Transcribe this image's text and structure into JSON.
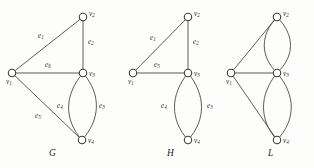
{
  "figure": {
    "background_color": "#fdfdfc",
    "stroke_color": "#4a4a48",
    "node_fill_color": "#ffffff"
  },
  "graphs": [
    {
      "id": "G",
      "caption": "G",
      "vertices": [
        {
          "id": "v1",
          "label": "v",
          "sub": "1",
          "x": 12,
          "y": 73
        },
        {
          "id": "v2",
          "label": "v",
          "sub": "2",
          "x": 83,
          "y": 17
        },
        {
          "id": "v3",
          "label": "v",
          "sub": "3",
          "x": 83,
          "y": 73
        },
        {
          "id": "v4",
          "label": "v",
          "sub": "4",
          "x": 82,
          "y": 140
        }
      ],
      "edges": [
        {
          "id": "e1",
          "label": "e",
          "sub": "1",
          "from": "v1",
          "to": "v2",
          "kind": "straight",
          "label_x": 38,
          "label_y": 36
        },
        {
          "id": "e2",
          "label": "e",
          "sub": "2",
          "from": "v2",
          "to": "v3",
          "kind": "straight",
          "label_x": 88,
          "label_y": 42
        },
        {
          "id": "e6",
          "label": "e",
          "sub": "6",
          "from": "v1",
          "to": "v3",
          "kind": "straight",
          "label_x": 45,
          "label_y": 64
        },
        {
          "id": "e5",
          "label": "e",
          "sub": "5",
          "from": "v1",
          "to": "v4",
          "kind": "straight",
          "label_x": 39,
          "label_y": 115
        },
        {
          "id": "e4",
          "label": "e",
          "sub": "4",
          "from": "v3",
          "to": "v4",
          "kind": "curve-left",
          "label_x": 60,
          "label_y": 106
        },
        {
          "id": "e3",
          "label": "e",
          "sub": "3",
          "from": "v3",
          "to": "v4",
          "kind": "curve-right",
          "label_x": 98,
          "label_y": 106
        }
      ]
    },
    {
      "id": "H",
      "caption": "H",
      "vertices": [
        {
          "id": "v1",
          "label": "v",
          "sub": "1",
          "x": 133,
          "y": 73
        },
        {
          "id": "v2",
          "label": "v",
          "sub": "2",
          "x": 188,
          "y": 17
        },
        {
          "id": "v3",
          "label": "v",
          "sub": "3",
          "x": 188,
          "y": 73
        },
        {
          "id": "v4",
          "label": "v",
          "sub": "4",
          "x": 188,
          "y": 140
        }
      ],
      "edges": [
        {
          "id": "e1",
          "label": "e",
          "sub": "1",
          "from": "v1",
          "to": "v2",
          "kind": "straight",
          "label_x": 152,
          "label_y": 38
        },
        {
          "id": "e2",
          "label": "e",
          "sub": "2",
          "from": "v2",
          "to": "v3",
          "kind": "straight",
          "label_x": 193,
          "label_y": 42
        },
        {
          "id": "e5",
          "label": "e",
          "sub": "5",
          "from": "v1",
          "to": "v3",
          "kind": "straight",
          "label_x": 155,
          "label_y": 64
        },
        {
          "id": "e4",
          "label": "e",
          "sub": "4",
          "from": "v3",
          "to": "v4",
          "kind": "curve-left",
          "label_x": 163,
          "label_y": 106
        },
        {
          "id": "e3",
          "label": "e",
          "sub": "3",
          "from": "v3",
          "to": "v4",
          "kind": "curve-right",
          "label_x": 206,
          "label_y": 106
        }
      ]
    },
    {
      "id": "L",
      "caption": "L",
      "vertices": [
        {
          "id": "v1",
          "label": "v",
          "sub": "1",
          "x": 231,
          "y": 73
        },
        {
          "id": "v2",
          "label": "v",
          "sub": "2",
          "x": 277,
          "y": 17
        },
        {
          "id": "v3",
          "label": "v",
          "sub": "3",
          "x": 277,
          "y": 73
        },
        {
          "id": "v4",
          "label": "v",
          "sub": "4",
          "x": 277,
          "y": 140
        }
      ],
      "edges": [
        {
          "id": "L-v1v2",
          "label": "",
          "sub": "",
          "from": "v1",
          "to": "v2",
          "kind": "straight"
        },
        {
          "id": "L-v1v3",
          "label": "",
          "sub": "",
          "from": "v1",
          "to": "v3",
          "kind": "straight"
        },
        {
          "id": "L-v1v4",
          "label": "",
          "sub": "",
          "from": "v1",
          "to": "v4",
          "kind": "straight"
        },
        {
          "id": "L-v2v3-a",
          "label": "",
          "sub": "",
          "from": "v2",
          "to": "v3",
          "kind": "curve-left"
        },
        {
          "id": "L-v2v3-b",
          "label": "",
          "sub": "",
          "from": "v2",
          "to": "v3",
          "kind": "curve-right"
        },
        {
          "id": "L-v3v4-a",
          "label": "",
          "sub": "",
          "from": "v3",
          "to": "v4",
          "kind": "curve-left"
        },
        {
          "id": "L-v3v4-b",
          "label": "",
          "sub": "",
          "from": "v3",
          "to": "v4",
          "kind": "curve-right"
        }
      ]
    }
  ],
  "captions": [
    {
      "text": "G",
      "x": 49,
      "y": 153
    },
    {
      "text": "H",
      "x": 167,
      "y": 153
    },
    {
      "text": "L",
      "x": 268,
      "y": 153
    }
  ]
}
